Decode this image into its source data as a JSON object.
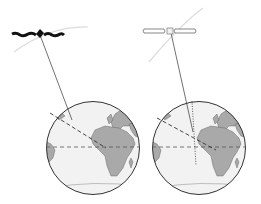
{
  "diagram": {
    "colors": {
      "ocean": "#f2f2f2",
      "land": "#a9a9a9",
      "outline": "#333333",
      "orbit": "#d8d8d8",
      "satellite_dark": "#111111",
      "satellite_light": "#ffffff"
    },
    "panels": [
      {
        "id": "left",
        "satellite_style": "dark",
        "globe_center": [
          93,
          148
        ],
        "radius": 47,
        "satellite": [
          40,
          33
        ]
      },
      {
        "id": "right",
        "satellite_style": "outline",
        "globe_center": [
          199,
          148
        ],
        "radius": 47,
        "satellite": [
          170,
          31
        ]
      }
    ]
  }
}
